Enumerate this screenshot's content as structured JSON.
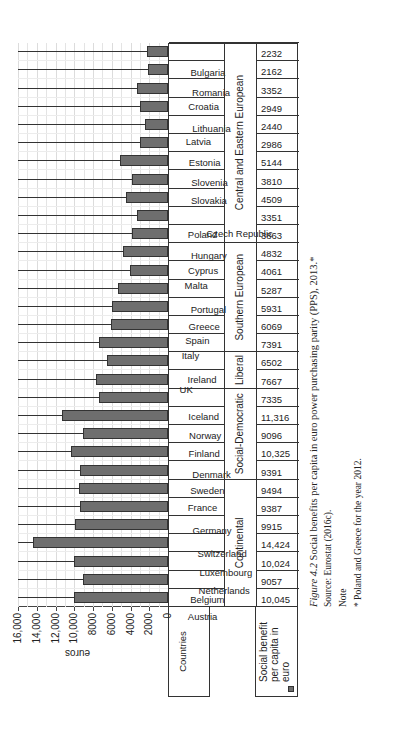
{
  "chart_data": {
    "type": "bar",
    "title": "Social benefits per capita in euro power purchasing parity (PPS), 2013.*",
    "xlabel": "Countries",
    "ylabel": "euros",
    "ylim": [
      0,
      16000
    ],
    "yticks": [
      "0",
      "2000",
      "4000",
      "6000",
      "8000",
      "10,000",
      "12,000",
      "14,000",
      "16,000"
    ],
    "grid": true,
    "legend": [
      "Social benefit per capita in euro"
    ],
    "categories": [
      "Austria",
      "Belgium",
      "Netherlands",
      "Luxembourg",
      "Switzerland",
      "Germany",
      "France",
      "Sweden",
      "Denmark",
      "Finland",
      "Norway",
      "Iceland",
      "UK",
      "Ireland",
      "Italy",
      "Spain",
      "Greece",
      "Portugal",
      "Malta",
      "Cyprus",
      "Hungary",
      "Poland",
      "Czech Republic",
      "Slovakia",
      "Slovenia",
      "Estonia",
      "Latvia",
      "Lithuania",
      "Croatia",
      "Romania",
      "Bulgaria"
    ],
    "groups": [
      {
        "name": "Continental",
        "count": 7
      },
      {
        "name": "Social-Democratic",
        "count": 5
      },
      {
        "name": "Liberal",
        "count": 2
      },
      {
        "name": "Southern European",
        "count": 6
      },
      {
        "name": "Central and Eastern European",
        "count": 11
      }
    ],
    "series": [
      {
        "name": "Social benefit per capita in euro",
        "values": [
          10045,
          9057,
          10024,
          14424,
          9915,
          9387,
          9494,
          9391,
          10325,
          9096,
          11316,
          7335,
          7667,
          6502,
          7391,
          6069,
          5931,
          5287,
          4061,
          4832,
          3863,
          3351,
          4509,
          3810,
          5144,
          2986,
          2440,
          2949,
          3352,
          2162,
          2232
        ]
      }
    ],
    "value_labels": [
      "10,045",
      "9057",
      "10,024",
      "14,424",
      "9915",
      "9387",
      "9494",
      "9391",
      "10,325",
      "9096",
      "11,316",
      "7335",
      "7667",
      "6502",
      "7391",
      "6069",
      "5931",
      "5287",
      "4061",
      "4832",
      "3863",
      "3351",
      "4509",
      "3810",
      "5144",
      "2986",
      "2440",
      "2949",
      "3352",
      "2162",
      "2232"
    ]
  },
  "table": {
    "countries_header": "Countries",
    "legend_label": "Social benefit per capita in euro"
  },
  "caption": {
    "figure_number": "Figure 4.2",
    "title": "Social benefits per capita in euro power purchasing parity (PPS), 2013.*",
    "source": "Source: Eurostat (2016c).",
    "note_heading": "Note",
    "note": "* Poland and Greece for the year 2012."
  }
}
